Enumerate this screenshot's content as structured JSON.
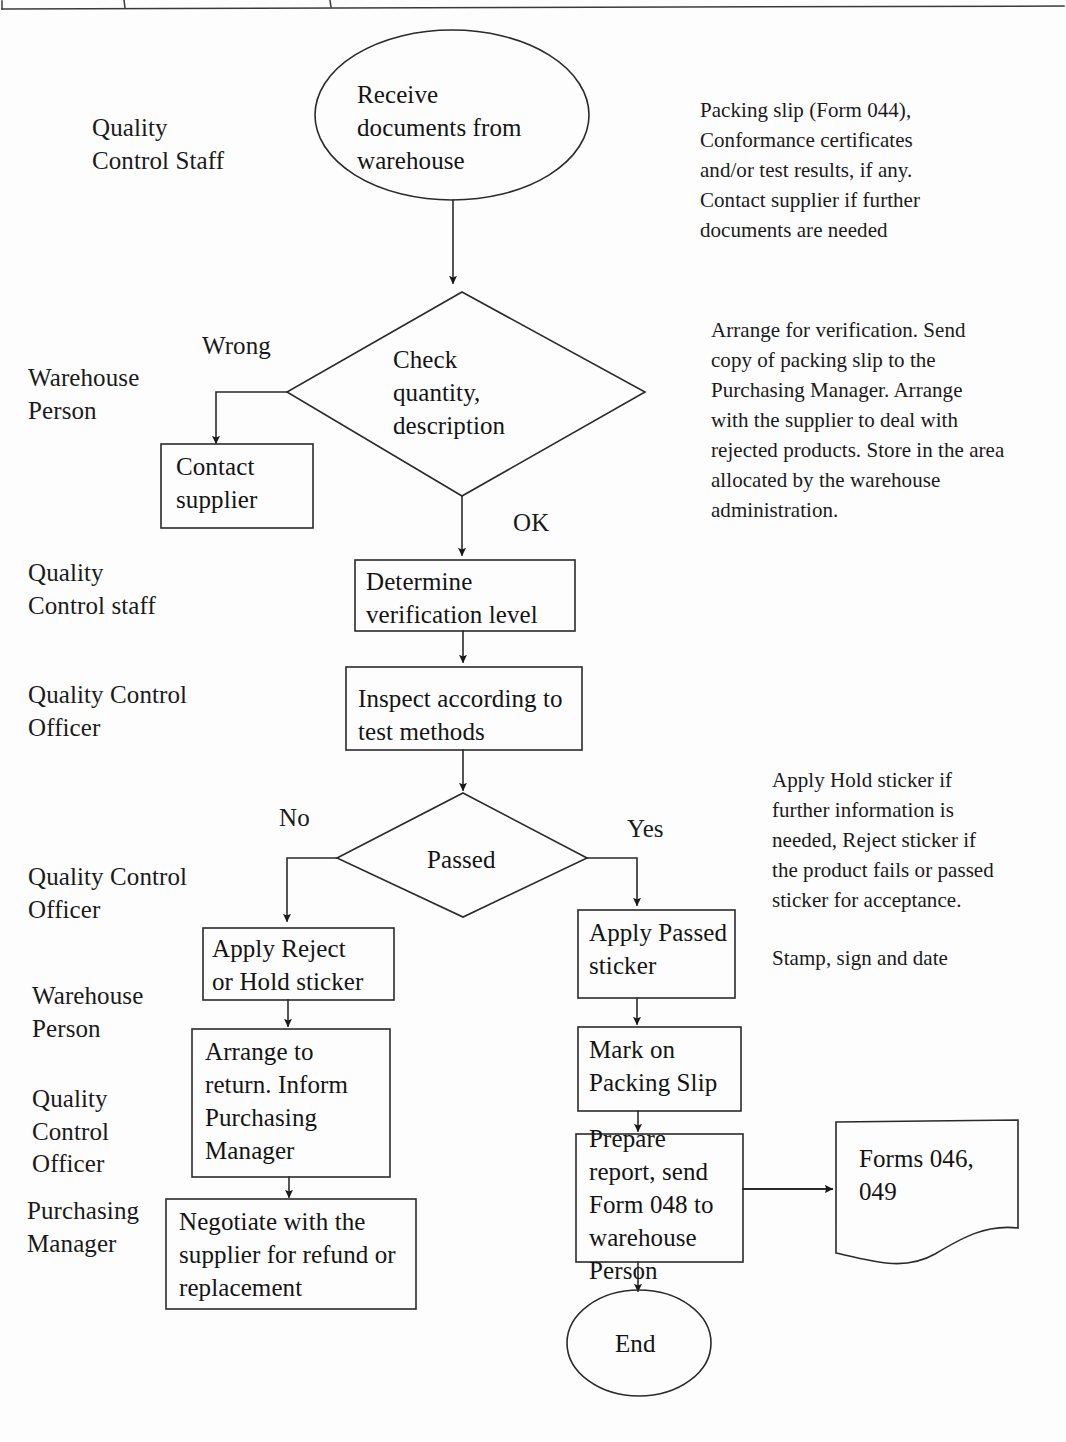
{
  "document": {
    "kind": "flowchart",
    "title": "Goods Receipt Inspection Process Flowchart",
    "ink_color": "#161616",
    "paper_color": "#fdfdfd"
  },
  "table_header_remnant": {
    "present": true,
    "description": "bottom rule of a table cut off at the top of the page with two vertical cell dividers"
  },
  "roles": [
    {
      "id": "role-1",
      "label": "Quality\nControl Staff"
    },
    {
      "id": "role-2",
      "label": "Warehouse\nPerson"
    },
    {
      "id": "role-3",
      "label": "Quality\nControl staff"
    },
    {
      "id": "role-4",
      "label": "Quality Control\nOfficer"
    },
    {
      "id": "role-5",
      "label": "Quality Control\nOfficer"
    },
    {
      "id": "role-6",
      "label": "Warehouse\nPerson"
    },
    {
      "id": "role-7",
      "label": "Quality\nControl\nOfficer"
    },
    {
      "id": "role-8",
      "label": "Purchasing\nManager"
    }
  ],
  "nodes": {
    "start": {
      "shape": "ellipse",
      "label": "Receive\ndocuments from\nwarehouse"
    },
    "check": {
      "shape": "diamond",
      "label": "Check\nquantity,\ndescription"
    },
    "contact_supplier": {
      "shape": "rect",
      "label": "Contact\nsupplier"
    },
    "determine_level": {
      "shape": "rect",
      "label": "Determine\nverification level"
    },
    "inspect": {
      "shape": "rect",
      "label": "Inspect according to\ntest methods"
    },
    "passed": {
      "shape": "diamond",
      "label": "Passed"
    },
    "apply_reject": {
      "shape": "rect",
      "label": "Apply Reject\nor Hold sticker"
    },
    "apply_passed": {
      "shape": "rect",
      "label": "Apply Passed\nsticker"
    },
    "arrange_return": {
      "shape": "rect",
      "label": "Arrange to\nreturn. Inform\nPurchasing\nManager"
    },
    "mark_packing_slip": {
      "shape": "rect",
      "label": "Mark on\nPacking Slip"
    },
    "negotiate": {
      "shape": "rect",
      "label": "Negotiate with the\nsupplier for refund or\nreplacement"
    },
    "prepare_report": {
      "shape": "rect",
      "label": "Prepare\nreport, send\nForm 048 to\nwarehouse\nPerson"
    },
    "forms": {
      "shape": "document",
      "label": "Forms 046,\n049"
    },
    "end": {
      "shape": "ellipse",
      "label": "End"
    }
  },
  "edge_labels": {
    "wrong": "Wrong",
    "ok": "OK",
    "no": "No",
    "yes": "Yes"
  },
  "notes": [
    {
      "id": "note-documents",
      "text": "Packing slip (Form 044),\nConformance certificates\nand/or test results, if any.\nContact supplier if further\ndocuments are needed"
    },
    {
      "id": "note-verification",
      "text": "Arrange for verification. Send\ncopy of packing slip to the\nPurchasing Manager.  Arrange\nwith the supplier to deal with\nrejected products. Store in the area\nallocated by the warehouse\nadministration."
    },
    {
      "id": "note-stickers",
      "text": "Apply Hold sticker if\nfurther information is\nneeded, Reject sticker if\nthe product fails or passed\nsticker for acceptance."
    },
    {
      "id": "note-stamp",
      "text": "Stamp, sign and date"
    }
  ]
}
